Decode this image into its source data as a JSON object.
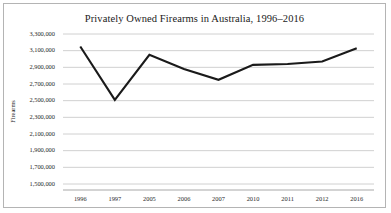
{
  "chart_data": {
    "type": "line",
    "title": "Privately Owned Firearms in Australia, 1996–2016",
    "xlabel": "",
    "ylabel": "Firearms",
    "categories": [
      "1996",
      "1997",
      "2005",
      "2006",
      "2007",
      "2010",
      "2011",
      "2012",
      "2016"
    ],
    "values": [
      3150000,
      2510000,
      3050000,
      2880000,
      2750000,
      2930000,
      2940000,
      2970000,
      3130000
    ],
    "ylim": [
      1500000,
      3300000
    ],
    "yticks": [
      3300000,
      3100000,
      2900000,
      2700000,
      2500000,
      2300000,
      2100000,
      1900000,
      1700000,
      1500000
    ],
    "ytick_labels": [
      "3,300,000",
      "3,100,000",
      "2,900,000",
      "2,700,000",
      "2,500,000",
      "2,300,000",
      "2,100,000",
      "1,900,000",
      "1,700,000",
      "1,500,000"
    ],
    "grid": true,
    "legend": false,
    "series_color": "#1a1a1a",
    "gridline_color": "#d0d0d0",
    "axis_color": "#a8a8a8",
    "background_color": "#ffffff",
    "border_color": "#b4b4b4"
  }
}
